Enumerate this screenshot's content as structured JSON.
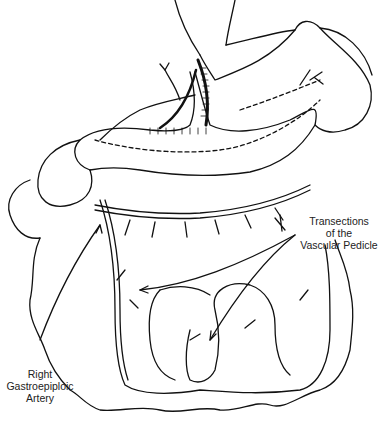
{
  "figure": {
    "type": "anatomical line drawing",
    "labels": {
      "transections": [
        "Transections",
        "of the",
        "Vascular Pedicle"
      ],
      "artery": [
        "Right",
        "Gastroepiploic",
        "Artery"
      ]
    }
  }
}
